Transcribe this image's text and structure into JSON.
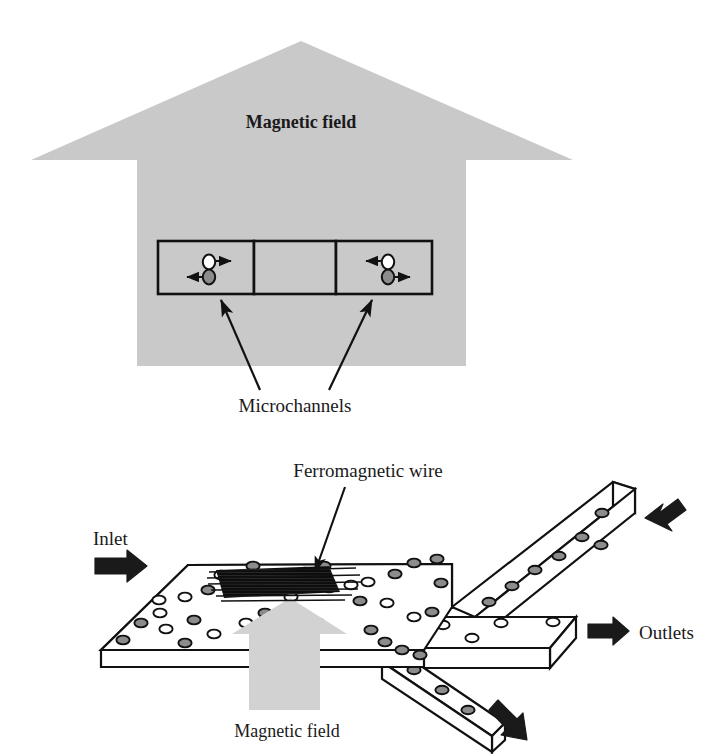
{
  "figure": {
    "panels": [
      {
        "id": "top",
        "name": "cross-section-view",
        "field_label": "Magnetic field",
        "callout_label": "Microchannels"
      },
      {
        "id": "bottom",
        "name": "three-dimensional-view",
        "inlet_label": "Inlet",
        "outlets_label": "Outlets",
        "wire_label": "Ferromagnetic wire",
        "field_label": "Magnetic field"
      }
    ]
  },
  "top_panel": {
    "field_arrow": {
      "name": "magnetic-field-arrow-up",
      "label": "Magnetic field",
      "fill": "#c9c9c9",
      "direction": "up"
    },
    "microchannels": {
      "callout": "Microchannels",
      "count": 3,
      "boxes": [
        {
          "index": 0,
          "name": "microchannel-box-left",
          "particles": [
            {
              "type": "nonmagnetic",
              "color": "#ffffff",
              "arrow": "right"
            },
            {
              "type": "magnetic",
              "color": "#8c8c8c",
              "arrow": "left"
            }
          ]
        },
        {
          "index": 1,
          "name": "microchannel-box-middle",
          "particles": []
        },
        {
          "index": 2,
          "name": "microchannel-box-right",
          "particles": [
            {
              "type": "nonmagnetic",
              "color": "#ffffff",
              "arrow": "left"
            },
            {
              "type": "magnetic",
              "color": "#8c8c8c",
              "arrow": "right"
            }
          ]
        }
      ]
    }
  },
  "bottom_panel": {
    "inlet": {
      "name": "inlet",
      "label": "Inlet",
      "arrow_direction": "right",
      "arrow_fill": "#1a1a1a"
    },
    "outlets": {
      "name": "outlets",
      "label": "Outlets",
      "count": 3,
      "channels": [
        {
          "index": 0,
          "name": "outlet-channel-upper",
          "direction": "up-right",
          "particle_type": "magnetic",
          "particle_color": "#8c8c8c"
        },
        {
          "index": 1,
          "name": "outlet-channel-middle",
          "direction": "right",
          "particle_type": "nonmagnetic",
          "particle_color": "#ffffff"
        },
        {
          "index": 2,
          "name": "outlet-channel-lower",
          "direction": "down-right",
          "particle_type": "magnetic",
          "particle_color": "#8c8c8c"
        }
      ]
    },
    "ferromagnetic_wire": {
      "name": "ferromagnetic-wire",
      "label": "Ferromagnetic wire",
      "color": "#111111",
      "style": "dense-horizontal-hatch"
    },
    "field_arrow": {
      "name": "magnetic-field-arrow-up",
      "label": "Magnetic field",
      "fill": "#d2d2d2",
      "direction": "up"
    },
    "chamber": {
      "name": "separation-chamber-slab",
      "fill": "#ffffff",
      "stroke": "#111111"
    }
  },
  "colors": {
    "gray_fill": "#c9c9c9",
    "light_gray_fill": "#d2d2d2",
    "particle_magnetic": "#8c8c8c",
    "particle_nonmagnetic": "#ffffff",
    "stroke": "#111111",
    "background": "#ffffff"
  }
}
